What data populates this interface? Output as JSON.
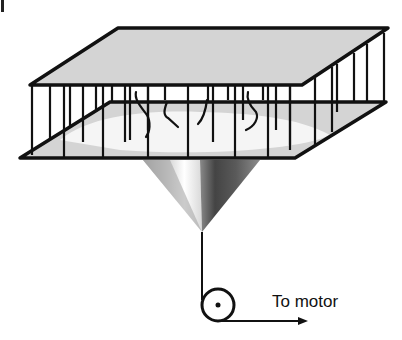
{
  "diagram": {
    "labels": {
      "motor": "To motor"
    },
    "colors": {
      "stroke": "#111111",
      "platform_fill": "#d4d4d4",
      "floor_highlight": "#f4f4f4",
      "background": "#ffffff"
    },
    "components": [
      {
        "id": "top-platform",
        "label": ""
      },
      {
        "id": "bottom-platform",
        "label": ""
      },
      {
        "id": "vertical-bars",
        "label": ""
      },
      {
        "id": "insects",
        "label": ""
      },
      {
        "id": "cone",
        "label": ""
      },
      {
        "id": "shaft",
        "label": ""
      },
      {
        "id": "pulley",
        "label": ""
      },
      {
        "id": "motor-arrow",
        "label": "To motor"
      }
    ]
  }
}
